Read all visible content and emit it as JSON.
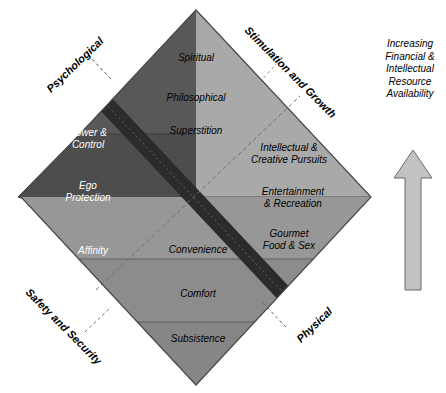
{
  "diagram": {
    "center": {
      "x": 196,
      "y": 197
    },
    "half_width": 175,
    "half_height": 187,
    "colors": {
      "top_band_1": "#ffffff",
      "top_band_2": "#f2f2f2",
      "top_band_3": "#ebebeb",
      "left_band_1": "#555555",
      "left_band_2": "#4a4a4a",
      "left_band_3": "#4f4f4f",
      "right_band_1": "#a8a8a8",
      "right_band_2": "#c0c0c0",
      "right_band_3": "#d4d4d4",
      "bottom_band_1": "#949494",
      "bottom_band_2": "#8a8a8a",
      "bottom_band_3": "#848484",
      "dark_overlay": "#2b2b2b",
      "arrow_fill": "#bfbfbf",
      "outline": "#444444"
    },
    "quadrants": [
      {
        "id": "top",
        "corner_label": "",
        "bands": [
          {
            "label": "Spiritual"
          },
          {
            "label": "Philosophical"
          },
          {
            "label": "Superstition"
          }
        ]
      },
      {
        "id": "left",
        "corner_label": "Psychological",
        "bands": [
          {
            "label": "Power &\nControl",
            "line1": "Power &",
            "line2": "Control"
          },
          {
            "label": "Ego\nProtection",
            "line1": "Ego",
            "line2": "Protection"
          },
          {
            "label": "Affinity",
            "line1": "Affinity",
            "line2": ""
          }
        ]
      },
      {
        "id": "right",
        "corner_label": "Stimulation and Growth",
        "bands": [
          {
            "line1": "Intellectual &",
            "line2": "Creative Pursuits"
          },
          {
            "line1": "Entertainment",
            "line2": "& Recreation"
          },
          {
            "line1": "Gourmet",
            "line2": "Food & Sex"
          }
        ]
      },
      {
        "id": "bottom",
        "corner_label": "Physical",
        "bands": [
          {
            "label": "Convenience"
          },
          {
            "label": "Comfort"
          },
          {
            "label": "Subsistence"
          }
        ]
      }
    ],
    "corner_labels": {
      "top_left": "Psychological",
      "top_right": "Stimulation and Growth",
      "bottom_left": "Safety and Security",
      "bottom_right": "Physical"
    },
    "side_caption": {
      "lines": [
        "Increasing",
        "Financial &",
        "Intellectual",
        "Resource",
        "Availability"
      ]
    },
    "arrow": {
      "name": "up-arrow",
      "direction": "up"
    }
  }
}
